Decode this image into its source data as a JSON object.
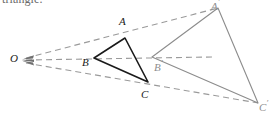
{
  "figure": {
    "caption_fragment": "triangle.",
    "colors": {
      "solid_triangle": "#1a1a1a",
      "image_triangle": "#8c8c8c",
      "ray_dashed": "#9a9a9a",
      "background": "#ffffff",
      "label": "#1a1a1a",
      "label_faint": "#8e8e8e"
    },
    "center_of_dilation": {
      "label": "O",
      "x": 22,
      "y": 60
    },
    "preimage_triangle": {
      "name": "ABC",
      "stroke": "#1a1a1a",
      "vertices": [
        {
          "label": "A",
          "x": 125,
          "y": 38,
          "label_x": 118,
          "label_y": 20
        },
        {
          "label": "B",
          "x": 94,
          "y": 58,
          "label_x": 83,
          "label_y": 58
        },
        {
          "label": "C",
          "x": 148,
          "y": 82,
          "label_x": 142,
          "label_y": 91
        }
      ]
    },
    "image_triangle": {
      "name": "A'B'C'",
      "stroke": "#8c8c8c",
      "vertices": [
        {
          "label": "A",
          "prime": "′",
          "x": 218,
          "y": 8,
          "label_x": 211,
          "label_y": -4
        },
        {
          "label": "B",
          "prime": "′",
          "x": 152,
          "y": 57,
          "label_x": 155,
          "label_y": 62
        },
        {
          "label": "C",
          "prime": "′",
          "x": 258,
          "y": 103,
          "label_x": 259,
          "label_y": 100
        }
      ]
    },
    "rays": [
      {
        "name": "ray-O-A-Aprime",
        "from": "O",
        "through": "A",
        "to": "A'"
      },
      {
        "name": "ray-O-B-Bprime",
        "from": "O",
        "through": "B",
        "to": "B'"
      },
      {
        "name": "ray-O-C-Cprime",
        "from": "O",
        "through": "C",
        "to": "C'"
      }
    ],
    "labels": {
      "O": "O",
      "A": "A",
      "B": "B",
      "C": "C",
      "A_prime": "A",
      "B_prime": "B",
      "C_prime": "C",
      "prime_mark": "′"
    }
  }
}
